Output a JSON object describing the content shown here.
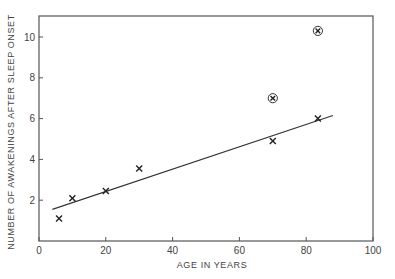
{
  "chart_data": {
    "type": "scatter",
    "title": "",
    "xlabel": "AGE IN YEARS",
    "ylabel": "NUMBER OF AWAKENINGS AFTER SLEEP ONSET",
    "xlim": [
      0,
      100
    ],
    "ylim": [
      0,
      11
    ],
    "xticks": [
      0,
      20,
      40,
      60,
      80,
      100
    ],
    "yticks": [
      2,
      4,
      6,
      8,
      10
    ],
    "grid": false,
    "legend": null,
    "series": [
      {
        "name": "awakenings",
        "marker": "x",
        "points": [
          {
            "x": 6,
            "y": 1.1
          },
          {
            "x": 10,
            "y": 2.1
          },
          {
            "x": 20,
            "y": 2.45
          },
          {
            "x": 30,
            "y": 3.55
          },
          {
            "x": 70,
            "y": 4.9
          },
          {
            "x": 83.5,
            "y": 6.0
          }
        ]
      },
      {
        "name": "circled points",
        "marker": "circled-x",
        "points": [
          {
            "x": 70,
            "y": 7.0
          },
          {
            "x": 83.5,
            "y": 10.3
          }
        ]
      }
    ],
    "fit_line": {
      "x1": 4,
      "y1": 1.55,
      "x2": 88,
      "y2": 6.15
    }
  }
}
